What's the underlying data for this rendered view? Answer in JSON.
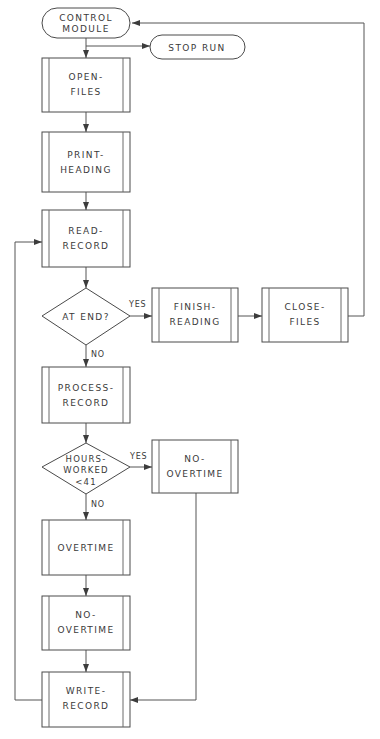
{
  "diagram": {
    "type": "flowchart",
    "colors": {
      "background": "#ffffff",
      "shape_stroke": "#4a4a4a",
      "inner_bar_stroke": "#6a6a6a",
      "connector": "#555555",
      "arrow_fill": "#3c3c3c",
      "text": "#3a3a3a"
    },
    "nodes": [
      {
        "id": "control-module",
        "shape": "terminal",
        "lines": [
          "CONTROL",
          "MODULE"
        ]
      },
      {
        "id": "stop-run",
        "shape": "terminal",
        "lines": [
          "STOP RUN"
        ]
      },
      {
        "id": "open-files",
        "shape": "predefined-process",
        "lines": [
          "OPEN-",
          "FILES"
        ]
      },
      {
        "id": "print-heading",
        "shape": "predefined-process",
        "lines": [
          "PRINT-",
          "HEADING"
        ]
      },
      {
        "id": "read-record",
        "shape": "predefined-process",
        "lines": [
          "READ-",
          "RECORD"
        ]
      },
      {
        "id": "at-end",
        "shape": "decision",
        "lines": [
          "AT END?"
        ]
      },
      {
        "id": "finish-reading",
        "shape": "predefined-process",
        "lines": [
          "FINISH-",
          "READING"
        ]
      },
      {
        "id": "close-files",
        "shape": "predefined-process",
        "lines": [
          "CLOSE-",
          "FILES"
        ]
      },
      {
        "id": "process-record",
        "shape": "predefined-process",
        "lines": [
          "PROCESS-",
          "RECORD"
        ]
      },
      {
        "id": "hours-worked",
        "shape": "decision",
        "lines": [
          "HOURS-",
          "WORKED",
          "<41"
        ]
      },
      {
        "id": "no-overtime-right",
        "shape": "predefined-process",
        "lines": [
          "NO-",
          "OVERTIME"
        ]
      },
      {
        "id": "overtime",
        "shape": "predefined-process",
        "lines": [
          "OVERTIME"
        ]
      },
      {
        "id": "no-overtime-lower",
        "shape": "predefined-process",
        "lines": [
          "NO-",
          "OVERTIME"
        ]
      },
      {
        "id": "write-record",
        "shape": "predefined-process",
        "lines": [
          "WRITE-",
          "RECORD"
        ]
      }
    ],
    "edge_labels": {
      "at_end_yes": "YES",
      "at_end_no": "NO",
      "hours_yes": "YES",
      "hours_no": "NO"
    },
    "text": {
      "control_module_l1": "CONTROL",
      "control_module_l2": "MODULE",
      "stop_run": "STOP RUN",
      "open_files_l1": "OPEN-",
      "open_files_l2": "FILES",
      "print_heading_l1": "PRINT-",
      "print_heading_l2": "HEADING",
      "read_record_l1": "READ-",
      "read_record_l2": "RECORD",
      "at_end": "AT END?",
      "finish_reading_l1": "FINISH-",
      "finish_reading_l2": "READING",
      "close_files_l1": "CLOSE-",
      "close_files_l2": "FILES",
      "process_record_l1": "PROCESS-",
      "process_record_l2": "RECORD",
      "hours_worked_l1": "HOURS-",
      "hours_worked_l2": "WORKED",
      "hours_worked_l3": "<41",
      "no_overtime_r_l1": "NO-",
      "no_overtime_r_l2": "OVERTIME",
      "overtime": "OVERTIME",
      "no_overtime_low_l1": "NO-",
      "no_overtime_low_l2": "OVERTIME",
      "write_record_l1": "WRITE-",
      "write_record_l2": "RECORD",
      "yes_1": "YES",
      "no_1": "NO",
      "yes_2": "YES",
      "no_2": "NO"
    }
  }
}
